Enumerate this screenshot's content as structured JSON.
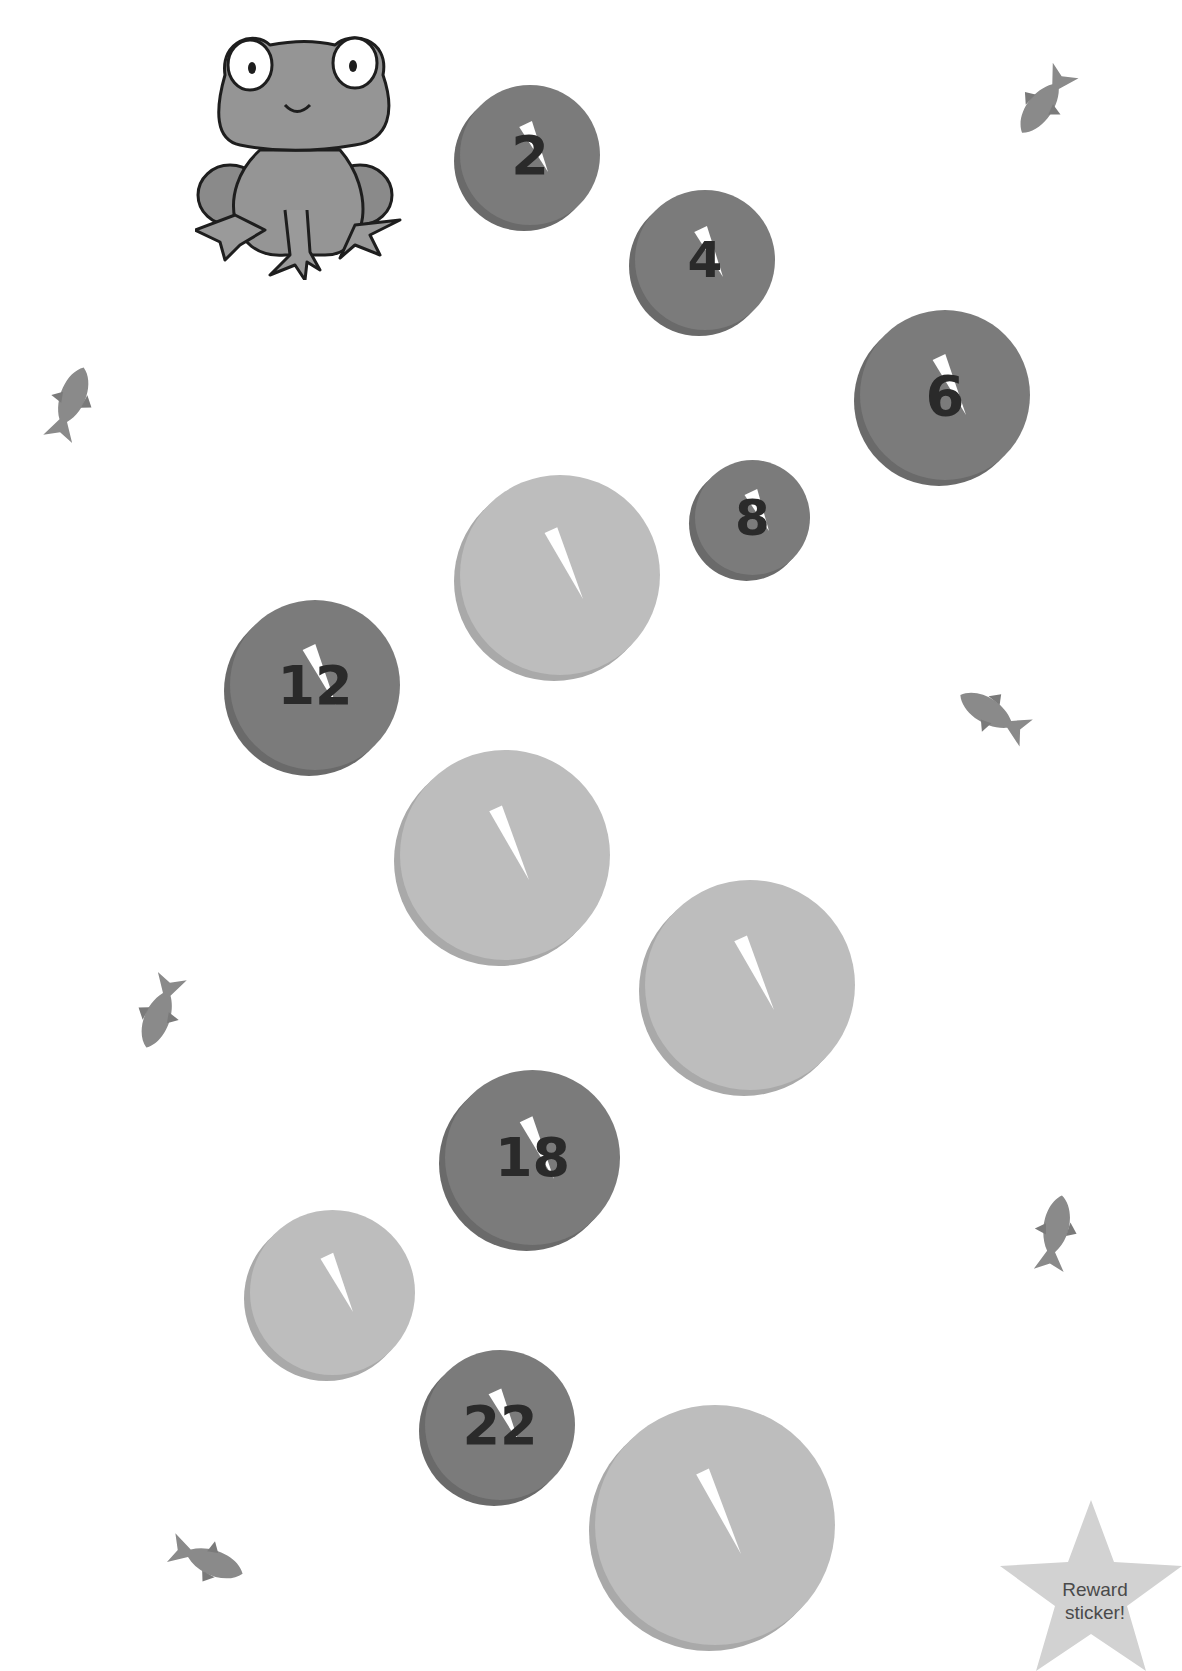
{
  "worksheet": {
    "pads": [
      {
        "label": "2",
        "type": "dark",
        "x": 460,
        "y": 85,
        "size": 140,
        "fs": 54
      },
      {
        "label": "4",
        "type": "dark",
        "x": 635,
        "y": 190,
        "size": 140,
        "fs": 50
      },
      {
        "label": "6",
        "type": "dark",
        "x": 860,
        "y": 310,
        "size": 170,
        "fs": 56
      },
      {
        "label": "8",
        "type": "dark",
        "x": 695,
        "y": 460,
        "size": 115,
        "fs": 50
      },
      {
        "label": "",
        "type": "light",
        "x": 460,
        "y": 475,
        "size": 200,
        "fs": 0
      },
      {
        "label": "12",
        "type": "dark",
        "x": 230,
        "y": 600,
        "size": 170,
        "fs": 54
      },
      {
        "label": "",
        "type": "light",
        "x": 400,
        "y": 750,
        "size": 210,
        "fs": 0
      },
      {
        "label": "",
        "type": "light",
        "x": 645,
        "y": 880,
        "size": 210,
        "fs": 0
      },
      {
        "label": "18",
        "type": "dark",
        "x": 445,
        "y": 1070,
        "size": 175,
        "fs": 54
      },
      {
        "label": "",
        "type": "light",
        "x": 250,
        "y": 1210,
        "size": 165,
        "fs": 0
      },
      {
        "label": "22",
        "type": "dark",
        "x": 425,
        "y": 1350,
        "size": 150,
        "fs": 54
      },
      {
        "label": "",
        "type": "light",
        "x": 595,
        "y": 1405,
        "size": 240,
        "fs": 0
      }
    ],
    "fish": [
      {
        "x": 1000,
        "y": 75,
        "rot": -55
      },
      {
        "x": 25,
        "y": 380,
        "rot": 110
      },
      {
        "x": 950,
        "y": 690,
        "rot": 30
      },
      {
        "x": 115,
        "y": 985,
        "rot": -70
      },
      {
        "x": 1010,
        "y": 1210,
        "rot": 100
      },
      {
        "x": 160,
        "y": 1535,
        "rot": 200
      }
    ],
    "reward": {
      "line1": "Reward",
      "line2": "sticker!"
    },
    "colors": {
      "dark_pad": "#7b7b7b",
      "light_pad": "#bdbdbd",
      "frog": "#8e8e8e",
      "star": "#d2d2d2"
    }
  }
}
